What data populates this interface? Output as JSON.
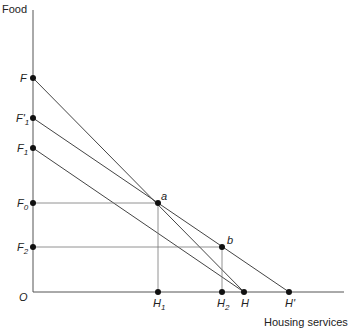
{
  "axes": {
    "y_label": "Food",
    "x_label": "Housing services",
    "origin_label": "O"
  },
  "y_points": [
    {
      "id": "F",
      "label": "F",
      "sub": "",
      "y": 78
    },
    {
      "id": "F1p",
      "label": "F'",
      "sub": "1",
      "y": 118
    },
    {
      "id": "F1",
      "label": "F",
      "sub": "1",
      "y": 148
    },
    {
      "id": "F0",
      "label": "F",
      "sub": "0",
      "y": 203
    },
    {
      "id": "F2",
      "label": "F",
      "sub": "2",
      "y": 247
    }
  ],
  "x_points": [
    {
      "id": "H1",
      "label": "H",
      "sub": "1",
      "x": 158
    },
    {
      "id": "H2",
      "label": "H",
      "sub": "2",
      "x": 222
    },
    {
      "id": "H",
      "label": "H",
      "sub": "",
      "x": 244
    },
    {
      "id": "Hp",
      "label": "H'",
      "sub": "",
      "x": 289
    }
  ],
  "interior_points": [
    {
      "id": "a",
      "label": "a",
      "x": 158,
      "y": 203
    },
    {
      "id": "b",
      "label": "b",
      "x": 222,
      "y": 247
    }
  ],
  "budget_lines": [
    {
      "from": "F",
      "to": "H"
    },
    {
      "from": "F1p",
      "to": "Hp"
    },
    {
      "from": "F1",
      "to": "H"
    }
  ]
}
